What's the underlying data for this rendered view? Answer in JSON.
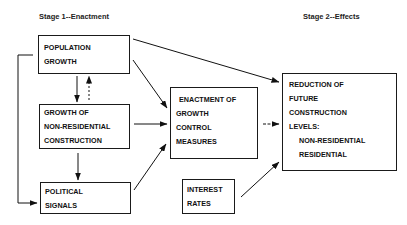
{
  "stages": {
    "stage1": "Stage 1--Enactment",
    "stage2": "Stage 2--Effects"
  },
  "nodes": {
    "population": {
      "lines": [
        "POPULATION",
        "GROWTH"
      ]
    },
    "nonres": {
      "lines": [
        "GROWTH OF",
        "NON-RESIDENTIAL",
        "CONSTRUCTION"
      ]
    },
    "political": {
      "lines": [
        "POLITICAL",
        "SIGNALS"
      ]
    },
    "enactment": {
      "lines": [
        "ENACTMENT OF",
        "GROWTH",
        "CONTROL",
        "MEASURES"
      ]
    },
    "interest": {
      "lines": [
        "INTEREST",
        "RATES"
      ]
    },
    "reduction": {
      "lines": [
        "REDUCTION OF",
        "FUTURE",
        "CONSTRUCTION",
        "LEVELS:",
        "NON-RESIDENTIAL",
        "RESIDENTIAL"
      ]
    }
  },
  "edges": [
    {
      "from": "population",
      "to": "nonres",
      "style": "solid"
    },
    {
      "from": "nonres",
      "to": "population",
      "style": "dotted"
    },
    {
      "from": "nonres",
      "to": "political",
      "style": "solid"
    },
    {
      "from": "population",
      "to": "political",
      "style": "solid"
    },
    {
      "from": "population",
      "to": "enactment",
      "style": "solid"
    },
    {
      "from": "nonres",
      "to": "enactment",
      "style": "solid"
    },
    {
      "from": "political",
      "to": "enactment",
      "style": "solid"
    },
    {
      "from": "population",
      "to": "reduction",
      "style": "solid"
    },
    {
      "from": "enactment",
      "to": "reduction",
      "style": "dashed"
    },
    {
      "from": "interest",
      "to": "reduction",
      "style": "solid"
    }
  ]
}
